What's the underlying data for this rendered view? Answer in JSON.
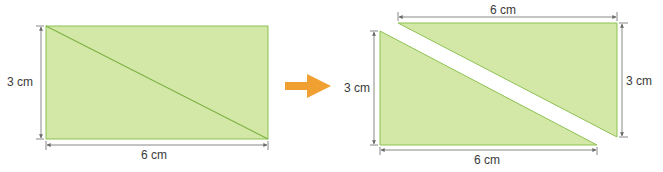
{
  "colors": {
    "fill": "#d3e8a6",
    "edge": "#8cc152",
    "diagonal": "#7fb245",
    "dimension_line": "#6a6a6a",
    "arrow": "#f0a030"
  },
  "left_figure": {
    "shape": "rectangle with diagonal",
    "height_label": "3 cm",
    "width_label": "6 cm"
  },
  "transform_arrow": {
    "icon": "arrow-right-icon"
  },
  "right_figure": {
    "shape": "two right triangles separated along diagonal",
    "top_triangle": {
      "width_label": "6 cm",
      "height_label": "3 cm"
    },
    "bottom_triangle": {
      "height_label": "3 cm",
      "width_label": "6 cm"
    }
  }
}
